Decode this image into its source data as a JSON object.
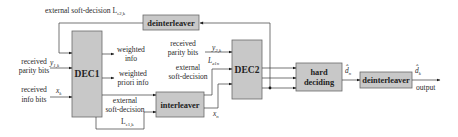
{
  "blocks": {
    "dec1": "DEC1",
    "dec2": "DEC2",
    "deinterleaver_top": "deinterleaver",
    "interleaver": "interleaver",
    "hard_deciding_line1": "hard",
    "hard_deciding_line2": "deciding",
    "deinterleaver_out": "deinterleaver"
  },
  "labels": {
    "feedback_prefix": "external soft-decision L",
    "feedback_sub": "e2,k",
    "rx_parity1_line1": "received",
    "rx_parity1_line2": "parity bits",
    "y1k_main": "y",
    "y1k_sub": "1,k",
    "rx_info_line1": "received",
    "rx_info_line2": "info bits",
    "xk_main": "x",
    "xk_sub": "k",
    "weighted_info_line1": "weighted",
    "weighted_info_line2": "info",
    "weighted_priori_line1": "weighted",
    "weighted_priori_line2": "priori info",
    "ext1_line1": "external",
    "ext1_line2": "soft-decision",
    "le1k_main": "L",
    "le1k_sub": "e1,k",
    "rx_parity2_line1": "received",
    "rx_parity2_line2": "parity bits",
    "y2k_main": "y",
    "y2k_sub": "2,k",
    "le1n_main": "L",
    "le1n_sub": "e1n",
    "ext2_line1": "external",
    "ext2_line2": "soft-decision",
    "xn_main": "x",
    "xn_sub": "n",
    "dn_main": "d̂",
    "dn_sub": "n",
    "dk_main": "d̂",
    "dk_sub": "k",
    "output": "output"
  },
  "colors": {
    "block_fill": "#c8c8c8",
    "line": "#3a3a3a"
  }
}
